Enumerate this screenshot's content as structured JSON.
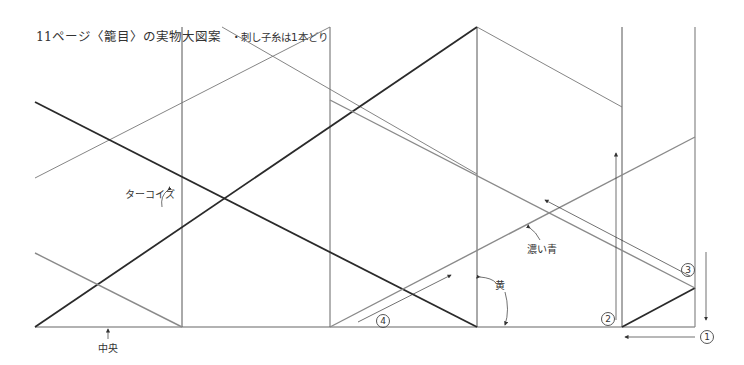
{
  "title": {
    "main": "11ページ〈籠目〉の実物大図案",
    "note": "・刺し子糸は1本どり"
  },
  "labels": {
    "turquoise": "ターコイズ",
    "dark_blue": "濃い青",
    "yellow": "黄",
    "center": "中央"
  },
  "markers": {
    "m1": "1",
    "m2": "2",
    "m3": "3",
    "m4": "4"
  },
  "colors": {
    "dark_line": "#2a2a2a",
    "gray_line": "#8a8a8a",
    "frame_line": "#555555",
    "text": "#333333"
  }
}
